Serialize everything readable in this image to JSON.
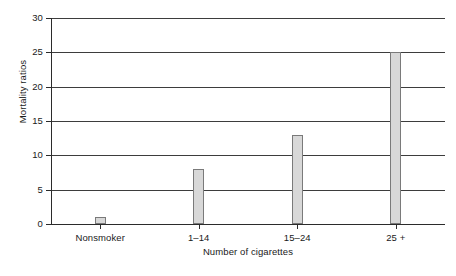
{
  "chart_data": {
    "type": "bar",
    "title": "",
    "xlabel": "Number of cigarettes",
    "ylabel": "Mortality ratios",
    "categories": [
      "Nonsmoker",
      "1–14",
      "15–24",
      "25 +"
    ],
    "values": [
      1,
      8,
      13,
      25
    ],
    "ylim": [
      0,
      30
    ],
    "yticks": [
      0,
      5,
      10,
      15,
      20,
      25,
      30
    ],
    "ytick_labels": [
      "0",
      "5",
      "10",
      "15",
      "20",
      "25",
      "30"
    ],
    "grid": "horizontal",
    "legend": "none",
    "bar_fill_color": "#d8d8d8",
    "bar_border_color": "#7a7a7a",
    "axis_color": "#2b2b2b",
    "gridline_color": "#3d3d3d"
  },
  "figure": {
    "caption_fragment": ""
  }
}
